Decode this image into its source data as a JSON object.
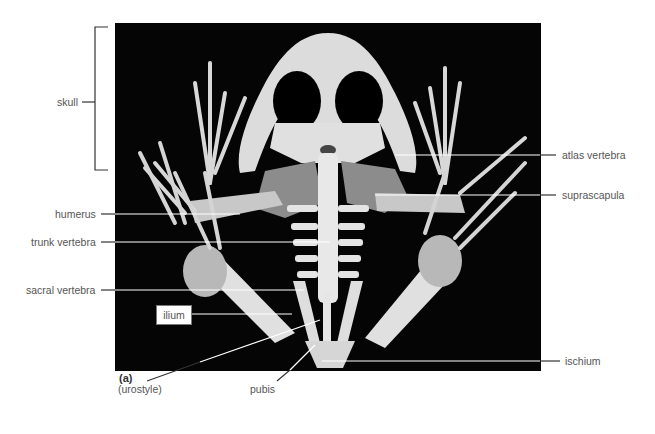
{
  "figure": {
    "panel_label": "(a)",
    "labels": {
      "skull": "skull",
      "humerus": "humerus",
      "trunk_vertebra": "trunk vertebra",
      "sacral_vertebra": "sacral vertebra",
      "ilium": "ilium",
      "urostyle": "(urostyle)",
      "pubis": "pubis",
      "atlas_vertebra": "atlas vertebra",
      "suprascapula": "suprascapula",
      "ischium": "ischium"
    },
    "colors": {
      "background": "#ffffff",
      "photo_bg": "#050505",
      "bone": "#e6e6e6",
      "cartilage": "#8c8c8c",
      "leader_line": "#ffffff",
      "leader_line_outside": "#333333",
      "label_text": "#555555"
    }
  }
}
